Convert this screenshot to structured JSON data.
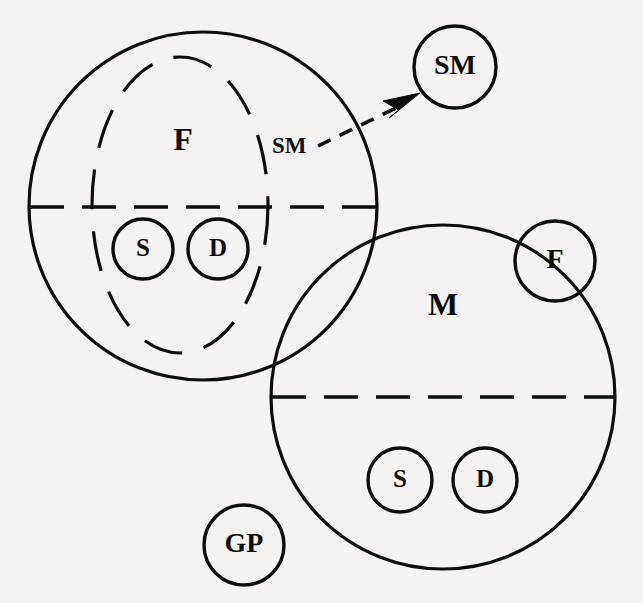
{
  "diagram": {
    "type": "set-venn-diagram",
    "background_color": "#f4f3f1",
    "stroke_color": "#0d0d0d",
    "big_sets": [
      {
        "key": "female",
        "label": "F",
        "label_x": 183,
        "label_y": 143,
        "cx": 203,
        "cy": 206,
        "r": 174,
        "divider_y": 207,
        "inner_ellipse": {
          "cx": 180,
          "cy": 205,
          "rx": 88,
          "ry": 148
        }
      },
      {
        "key": "male",
        "label": "M",
        "label_x": 443,
        "label_y": 308,
        "cx": 443,
        "cy": 397,
        "r": 172,
        "divider_y": 397
      }
    ],
    "small_nodes": [
      {
        "key": "f-son",
        "label": "S",
        "cx": 143,
        "cy": 249,
        "r": 30,
        "size": "small"
      },
      {
        "key": "f-daughter",
        "label": "D",
        "cx": 218,
        "cy": 249,
        "r": 30,
        "size": "small"
      },
      {
        "key": "m-son",
        "label": "S",
        "cx": 400,
        "cy": 480,
        "r": 32,
        "size": "small"
      },
      {
        "key": "m-daughter",
        "label": "D",
        "cx": 485,
        "cy": 480,
        "r": 32,
        "size": "small"
      },
      {
        "key": "stepmother",
        "label": "SM",
        "cx": 455,
        "cy": 67,
        "r": 41,
        "size": "mid"
      },
      {
        "key": "father-in-m",
        "label": "F",
        "cx": 555,
        "cy": 261,
        "r": 40,
        "size": "mid"
      },
      {
        "key": "grandparent",
        "label": "GP",
        "cx": 244,
        "cy": 545,
        "r": 40,
        "size": "mid"
      }
    ],
    "annotations": [
      {
        "key": "sm-inline-label",
        "label": "SM",
        "x": 272,
        "y": 148
      }
    ],
    "arrows": [
      {
        "key": "sm-arrow",
        "from_label": "SM",
        "to_label": "SM",
        "x1": 318,
        "y1": 145,
        "x2": 413,
        "y2": 99,
        "style": "dashed"
      }
    ]
  }
}
